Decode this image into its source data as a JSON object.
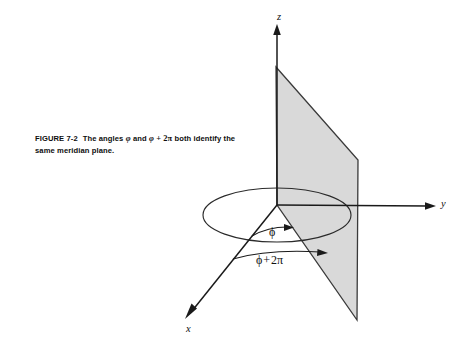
{
  "figure": {
    "caption": {
      "figure_label": "FIGURE 7-2",
      "text_part1": "The angles",
      "symbol1": "φ",
      "text_part2": "and",
      "symbol2": "φ",
      "operator": "+",
      "term": "2π",
      "text_part3": "both identify the",
      "line2": "same meridian plane."
    },
    "axes": [
      {
        "name": "z-axis",
        "label": "z",
        "direction": "up"
      },
      {
        "name": "y-axis",
        "label": "y",
        "direction": "right"
      },
      {
        "name": "x-axis",
        "label": "x",
        "direction": "down-left"
      }
    ],
    "annotations": {
      "angle_phi": "ϕ",
      "angle_phi_plus_2pi_symbol": "ϕ",
      "angle_phi_plus_2pi_operator": "+",
      "angle_phi_plus_2pi_term": "2π"
    },
    "shapes": {
      "meridian_plane_name": "meridian-plane",
      "circle_name": "azimuthal-circle"
    },
    "colors": {
      "plane_fill": "#d9d9d9",
      "plane_stroke": "#3a3a3a",
      "line": "#1a1a1a",
      "background": "#ffffff"
    }
  }
}
